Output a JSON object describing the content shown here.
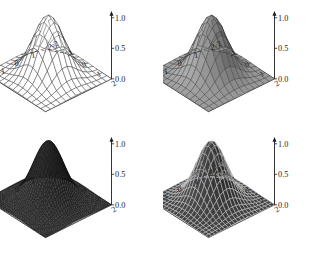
{
  "figure": {
    "background_color": "#ffffff",
    "layout": "2x2-grid",
    "panel_count": 4
  },
  "chart_data": [
    {
      "type": "surface",
      "title": "",
      "panel_index": 0,
      "position": "top-left",
      "style": "wireframe-mesh",
      "fill": "none",
      "mesh_color": "#2b2b2b",
      "mesh_density": "coarse",
      "function": "gaussian bump z = exp(-(x^2+y^2))",
      "xlabel": "",
      "ylabel": "",
      "zlabel": "",
      "xlim": [
        -2,
        2
      ],
      "ylim": [
        -2,
        2
      ],
      "zlim": [
        0.0,
        1.0
      ],
      "xticks": [
        "-2",
        "-1",
        "0",
        "1",
        "2"
      ],
      "yticks": [
        "-2",
        "-1",
        "0",
        "1",
        "2"
      ],
      "zticks": [
        "0.0",
        "0.5",
        "1.0"
      ],
      "peak_value": 1.0,
      "peak_x": 0,
      "peak_y": 0,
      "grid": true,
      "legend": "none"
    },
    {
      "type": "surface",
      "title": "",
      "panel_index": 1,
      "position": "top-right",
      "style": "shaded-surface-with-mesh",
      "fill": "#8a8a8a",
      "mesh_color": "#3a3a3a",
      "mesh_density": "coarse",
      "function": "gaussian bump z = exp(-(x^2+y^2))",
      "xlabel": "",
      "ylabel": "",
      "zlabel": "",
      "xlim": [
        -2,
        2
      ],
      "ylim": [
        -2,
        2
      ],
      "zlim": [
        0.0,
        1.0
      ],
      "xticks": [
        "-2",
        "-1",
        "0",
        "1",
        "2"
      ],
      "yticks": [
        "-2",
        "-1",
        "0",
        "1",
        "2"
      ],
      "zticks": [
        "0.0",
        "0.5",
        "1.0"
      ],
      "peak_value": 1.0,
      "peak_x": 0,
      "peak_y": 0,
      "grid": true,
      "legend": "none"
    },
    {
      "type": "surface",
      "title": "",
      "panel_index": 2,
      "position": "bottom-left",
      "style": "dense-dark-mesh",
      "fill": "#2a2a2a",
      "mesh_color": "#111111",
      "mesh_density": "fine",
      "function": "gaussian bump z = exp(-(x^2+y^2))",
      "xlabel": "",
      "ylabel": "",
      "zlabel": "",
      "xlim": [
        -2,
        2
      ],
      "ylim": [
        -2,
        2
      ],
      "zlim": [
        0.0,
        1.0
      ],
      "xticks": [
        "-2",
        "-1",
        "0",
        "1",
        "2"
      ],
      "yticks": [
        "-2",
        "-1",
        "0",
        "1",
        "2"
      ],
      "zticks": [
        "0.0",
        "0.5",
        "1.0"
      ],
      "peak_value": 1.0,
      "peak_x": 0,
      "peak_y": 0,
      "grid": true,
      "legend": "none"
    },
    {
      "type": "surface",
      "title": "",
      "panel_index": 3,
      "position": "bottom-right",
      "style": "dark-shaded-with-mesh",
      "fill": "#3c3c3c",
      "mesh_color": "#d8d8d8",
      "mesh_density": "medium",
      "function": "gaussian bump z = exp(-(x^2+y^2))",
      "xlabel": "",
      "ylabel": "",
      "zlabel": "",
      "xlim": [
        -2,
        2
      ],
      "ylim": [
        -2,
        2
      ],
      "zlim": [
        0.0,
        1.0
      ],
      "xticks": [
        "-2",
        "-1",
        "0",
        "1",
        "2"
      ],
      "yticks": [
        "-2",
        "-1",
        "0",
        "1",
        "2"
      ],
      "zticks": [
        "0.0",
        "0.5",
        "1.0"
      ],
      "peak_value": 1.0,
      "peak_x": 0,
      "peak_y": 0,
      "grid": true,
      "legend": "none"
    }
  ],
  "axis_text": {
    "x": [
      "-2",
      "-1",
      "0",
      "1",
      "2"
    ],
    "y": [
      "-2",
      "-1",
      "0",
      "1",
      "2"
    ],
    "z": [
      "0.0",
      "0.5",
      "1.0"
    ]
  }
}
